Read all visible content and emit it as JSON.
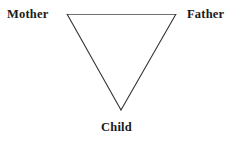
{
  "figure": {
    "background_color": "#ffffff",
    "width": 241,
    "height": 142,
    "shape": {
      "name": "inverted-triangle",
      "stroke_color_top": "#6f6f6f",
      "stroke_color_sides": "#333333",
      "stroke_width": 1,
      "fill": "none",
      "vertices": {
        "top_left": {
          "x": 67,
          "y": 14
        },
        "top_right": {
          "x": 176,
          "y": 14
        },
        "bottom": {
          "x": 121,
          "y": 110
        }
      }
    },
    "labels": {
      "mother": "Mother",
      "father": "Father",
      "child": "Child"
    }
  }
}
